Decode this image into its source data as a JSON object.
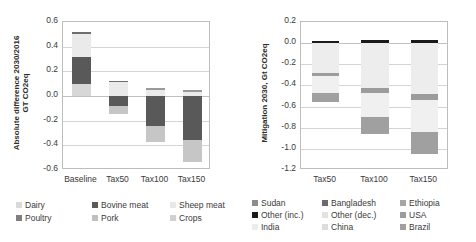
{
  "figure": {
    "width": 476,
    "height": 242,
    "background": "#ffffff"
  },
  "chart_data": [
    {
      "id": "left-panel",
      "type": "bar",
      "stacked": true,
      "title": "",
      "xlabel": "",
      "ylabel": "Absolute difference 2030/2016 GT CO2eq",
      "ylabel_line1": "Absolute difference 2030/2016",
      "ylabel_line2": "GT CO2eq",
      "categories": [
        "Baseline",
        "Tax50",
        "Tax100",
        "Tax150"
      ],
      "ylim": [
        -0.6,
        0.6
      ],
      "yticks": [
        0.6,
        0.4,
        0.2,
        0.0,
        -0.2,
        -0.4,
        -0.6
      ],
      "ytick_labels": [
        "0.6",
        "0.4",
        "0.2",
        "0.0",
        "-0.2",
        "-0.4",
        "-0.6"
      ],
      "grid": true,
      "legend_position": "bottom",
      "series": [
        {
          "name": "Dairy",
          "color": "#d9d9d9",
          "values": [
            0.095,
            0.03,
            0.022,
            0.02
          ]
        },
        {
          "name": "Bovine meat",
          "color": "#595959",
          "values": [
            0.225,
            -0.085,
            -0.215,
            -0.295
          ]
        },
        {
          "name": "Sheep meat",
          "color": "#e8e8e8",
          "values": [
            0.18,
            0.05,
            0.035,
            0.03
          ]
        },
        {
          "name": "Poultry",
          "color": "#7f7f7f",
          "values": [
            0.02,
            0.012,
            0.008,
            0.006
          ]
        },
        {
          "name": "Pork",
          "color": "#bfbfbf",
          "values": [
            0.0,
            -0.05,
            -0.135,
            -0.18
          ]
        },
        {
          "name": "Crops",
          "color": "#d0d0d0",
          "values": [
            0.0,
            0.0,
            0.0,
            0.0
          ]
        }
      ],
      "bar_totals_positive": [
        0.52,
        0.125,
        0.065,
        0.045
      ],
      "bar_totals_negative": [
        0.0,
        -0.145,
        -0.375,
        -0.535
      ],
      "legend": [
        {
          "label": "Dairy",
          "color": "#d9d9d9"
        },
        {
          "label": "Bovine meat",
          "color": "#595959"
        },
        {
          "label": "Sheep meat",
          "color": "#e8e8e8"
        },
        {
          "label": "Poultry",
          "color": "#7f7f7f"
        },
        {
          "label": "Pork",
          "color": "#bfbfbf"
        },
        {
          "label": "Crops",
          "color": "#d0d0d0"
        }
      ],
      "bars": [
        {
          "category": "Baseline",
          "segments": [
            {
              "name": "Poultry",
              "from": 0.5,
              "to": 0.52,
              "color": "#6e6e6e"
            },
            {
              "name": "Sheep meat",
              "from": 0.32,
              "to": 0.5,
              "color": "#eaeaea"
            },
            {
              "name": "Bovine meat",
              "from": 0.095,
              "to": 0.32,
              "color": "#595959"
            },
            {
              "name": "Dairy",
              "from": 0.0,
              "to": 0.095,
              "color": "#d7d7d7"
            }
          ]
        },
        {
          "category": "Tax50",
          "segments": [
            {
              "name": "Poultry",
              "from": 0.112,
              "to": 0.125,
              "color": "#6e6e6e"
            },
            {
              "name": "Sheep meat",
              "from": 0.0,
              "to": 0.112,
              "color": "#eaeaea"
            },
            {
              "name": "Bovine meat",
              "from": -0.085,
              "to": 0.0,
              "color": "#595959"
            },
            {
              "name": "Pork",
              "from": -0.145,
              "to": -0.085,
              "color": "#c6c6c6"
            }
          ]
        },
        {
          "category": "Tax100",
          "segments": [
            {
              "name": "Poultry",
              "from": 0.05,
              "to": 0.065,
              "color": "#9a9a9a"
            },
            {
              "name": "Sheep meat",
              "from": 0.0,
              "to": 0.05,
              "color": "#eaeaea"
            },
            {
              "name": "Bovine meat",
              "from": -0.245,
              "to": 0.0,
              "color": "#595959"
            },
            {
              "name": "Pork",
              "from": -0.375,
              "to": -0.245,
              "color": "#c6c6c6"
            }
          ]
        },
        {
          "category": "Tax150",
          "segments": [
            {
              "name": "Poultry",
              "from": 0.03,
              "to": 0.045,
              "color": "#9a9a9a"
            },
            {
              "name": "Sheep meat",
              "from": 0.0,
              "to": 0.03,
              "color": "#eaeaea"
            },
            {
              "name": "Bovine meat",
              "from": -0.355,
              "to": 0.0,
              "color": "#595959"
            },
            {
              "name": "Pork",
              "from": -0.535,
              "to": -0.355,
              "color": "#c6c6c6"
            }
          ]
        }
      ]
    },
    {
      "id": "right-panel",
      "type": "bar",
      "stacked": true,
      "title": "",
      "xlabel": "",
      "ylabel": "Mitigation 2030, Gt CO2eq",
      "categories": [
        "Tax50",
        "Tax100",
        "Tax150"
      ],
      "ylim": [
        -1.2,
        0.2
      ],
      "yticks": [
        0.2,
        0.0,
        -0.2,
        -0.4,
        -0.6,
        -0.8,
        -1.0,
        -1.2
      ],
      "ytick_labels": [
        "0.2",
        "0.0",
        "-0.2",
        "-0.4",
        "-0.6",
        "-0.8",
        "-1.0",
        "-1.2"
      ],
      "grid": true,
      "legend_position": "bottom",
      "legend": [
        {
          "label": "Sudan",
          "color": "#8c8c8c"
        },
        {
          "label": "Bangladesh",
          "color": "#6b6b6b"
        },
        {
          "label": "Ethiopia",
          "color": "#a6a6a6"
        },
        {
          "label": "Other (inc.)",
          "color": "#1a1a1a"
        },
        {
          "label": "Other (dec.)",
          "color": "#e2e2e2"
        },
        {
          "label": "USA",
          "color": "#9c9c9c"
        },
        {
          "label": "India",
          "color": "#ededed"
        },
        {
          "label": "China",
          "color": "#dcdcdc"
        },
        {
          "label": "Brazil",
          "color": "#a0a0a0"
        }
      ],
      "bars": [
        {
          "category": "Tax50",
          "segments": [
            {
              "name": "Other (inc.)",
              "from": 0.0,
              "to": 0.022,
              "color": "#1a1a1a"
            },
            {
              "name": "Other (dec.)",
              "from": -0.285,
              "to": 0.0,
              "color": "#ededed"
            },
            {
              "name": "USA",
              "from": -0.315,
              "to": -0.285,
              "color": "#9c9c9c"
            },
            {
              "name": "China",
              "from": -0.47,
              "to": -0.315,
              "color": "#f0f0f0"
            },
            {
              "name": "Brazil",
              "from": -0.56,
              "to": -0.47,
              "color": "#a0a0a0"
            }
          ]
        },
        {
          "category": "Tax100",
          "segments": [
            {
              "name": "Other (inc.)",
              "from": 0.0,
              "to": 0.03,
              "color": "#1a1a1a"
            },
            {
              "name": "Other (dec.)",
              "from": -0.425,
              "to": 0.0,
              "color": "#ededed"
            },
            {
              "name": "USA",
              "from": -0.47,
              "to": -0.425,
              "color": "#9c9c9c"
            },
            {
              "name": "China",
              "from": -0.7,
              "to": -0.47,
              "color": "#f0f0f0"
            },
            {
              "name": "Brazil",
              "from": -0.86,
              "to": -0.7,
              "color": "#a0a0a0"
            }
          ]
        },
        {
          "category": "Tax150",
          "segments": [
            {
              "name": "Other (inc.)",
              "from": 0.0,
              "to": 0.03,
              "color": "#1a1a1a"
            },
            {
              "name": "Other (dec.)",
              "from": -0.48,
              "to": 0.0,
              "color": "#ededed"
            },
            {
              "name": "USA",
              "from": -0.535,
              "to": -0.48,
              "color": "#9c9c9c"
            },
            {
              "name": "China",
              "from": -0.84,
              "to": -0.535,
              "color": "#f0f0f0"
            },
            {
              "name": "Brazil",
              "from": -1.05,
              "to": -0.84,
              "color": "#a0a0a0"
            }
          ]
        }
      ]
    }
  ]
}
